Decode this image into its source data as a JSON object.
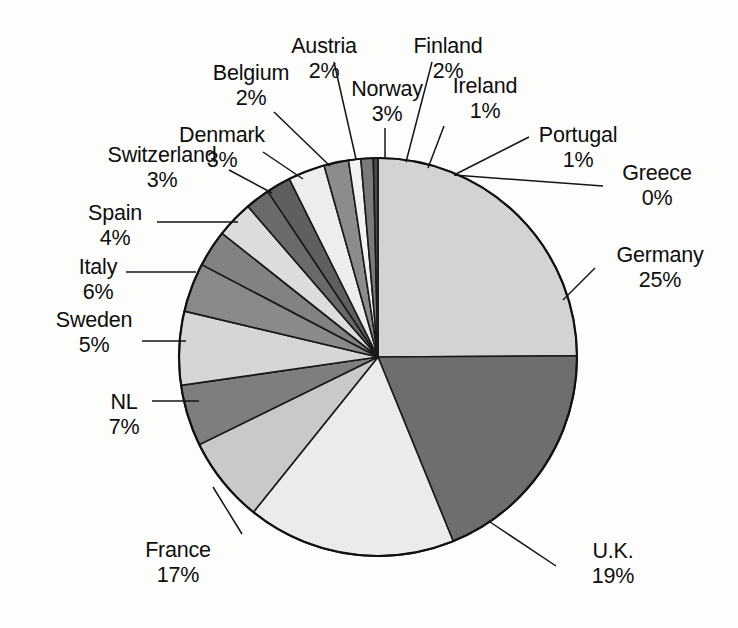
{
  "chart_data": {
    "type": "pie",
    "title": "",
    "subtitle": "",
    "xlabel": "",
    "ylabel": "",
    "legend": "none",
    "grid": false,
    "units": "percent",
    "label_format": "name above value, value as integer percent",
    "start_angle_deg": 0,
    "direction": "clockwise",
    "center": {
      "x": 378,
      "y": 357
    },
    "radius": 199,
    "categories": [
      "Germany",
      "U.K.",
      "France",
      "NL",
      "Sweden",
      "Italy",
      "Spain",
      "Switzerland",
      "Denmark",
      "Belgium",
      "Austria",
      "Norway",
      "Finland",
      "Ireland",
      "Portugal",
      "Greece"
    ],
    "values": [
      25,
      19,
      17,
      7,
      5,
      6,
      4,
      3,
      3,
      2,
      2,
      3,
      2,
      1,
      1,
      0
    ],
    "value_labels": [
      "25%",
      "19%",
      "17%",
      "7%",
      "5%",
      "6%",
      "4%",
      "3%",
      "3%",
      "2%",
      "2%",
      "3%",
      "2%",
      "1%",
      "1%",
      "0%"
    ],
    "slice_colors": [
      "#d3d3d3",
      "#6e6e6e",
      "#ebebeb",
      "#c9c9c9",
      "#7e7e7e",
      "#d6d6d6",
      "#8a8a8a",
      "#828282",
      "#dcdcdc",
      "#6a6a6a",
      "#5f5f5f",
      "#ededed",
      "#8c8c8c",
      "#f2f2f2",
      "#7a7a7a",
      "#4a4a4a"
    ],
    "slices": [
      {
        "name": "Germany",
        "value": 25,
        "label": "25%",
        "color": "#d3d3d3"
      },
      {
        "name": "U.K.",
        "value": 19,
        "label": "19%",
        "color": "#6e6e6e"
      },
      {
        "name": "France",
        "value": 17,
        "label": "17%",
        "color": "#ebebeb"
      },
      {
        "name": "NL",
        "value": 7,
        "label": "7%",
        "color": "#c9c9c9"
      },
      {
        "name": "Sweden",
        "value": 5,
        "label": "5%",
        "color": "#7e7e7e"
      },
      {
        "name": "Italy",
        "value": 6,
        "label": "6%",
        "color": "#d6d6d6"
      },
      {
        "name": "Spain",
        "value": 4,
        "label": "4%",
        "color": "#8a8a8a"
      },
      {
        "name": "Switzerland",
        "value": 3,
        "label": "3%",
        "color": "#828282"
      },
      {
        "name": "Denmark",
        "value": 3,
        "label": "3%",
        "color": "#dcdcdc"
      },
      {
        "name": "Belgium",
        "value": 2,
        "label": "2%",
        "color": "#6a6a6a"
      },
      {
        "name": "Austria",
        "value": 2,
        "label": "2%",
        "color": "#5f5f5f"
      },
      {
        "name": "Norway",
        "value": 3,
        "label": "3%",
        "color": "#ededed"
      },
      {
        "name": "Finland",
        "value": 2,
        "label": "2%",
        "color": "#8c8c8c"
      },
      {
        "name": "Ireland",
        "value": 1,
        "label": "1%",
        "color": "#f2f2f2"
      },
      {
        "name": "Portugal",
        "value": 1,
        "label": "1%",
        "color": "#7a7a7a"
      },
      {
        "name": "Greece",
        "value": 0,
        "label": "0%",
        "color": "#4a4a4a"
      }
    ],
    "background_color": "#fdfdfc",
    "outline_color": "#111111"
  },
  "labels": {
    "germany": {
      "name": "Germany",
      "value": "25%"
    },
    "uk": {
      "name": "U.K.",
      "value": "19%"
    },
    "france": {
      "name": "France",
      "value": "17%"
    },
    "nl": {
      "name": "NL",
      "value": "7%"
    },
    "sweden": {
      "name": "Sweden",
      "value": "5%"
    },
    "italy": {
      "name": "Italy",
      "value": "6%"
    },
    "spain": {
      "name": "Spain",
      "value": "4%"
    },
    "switzerland": {
      "name": "Switzerland",
      "value": "3%"
    },
    "denmark": {
      "name": "Denmark",
      "value": "3%"
    },
    "belgium": {
      "name": "Belgium",
      "value": "2%"
    },
    "austria": {
      "name": "Austria",
      "value": "2%"
    },
    "norway": {
      "name": "Norway",
      "value": "3%"
    },
    "finland": {
      "name": "Finland",
      "value": "2%"
    },
    "ireland": {
      "name": "Ireland",
      "value": "1%"
    },
    "portugal": {
      "name": "Portugal",
      "value": "1%"
    },
    "greece": {
      "name": "Greece",
      "value": "0%"
    }
  }
}
